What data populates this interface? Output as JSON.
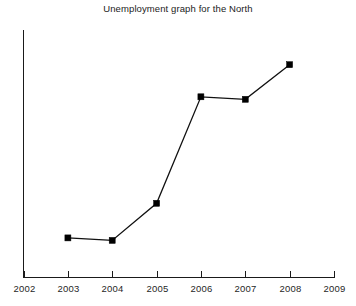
{
  "chart_data": {
    "type": "line",
    "title": "Unemployment graph for the North",
    "xlabel": "",
    "ylabel": "",
    "grid": false,
    "legend": false,
    "axis_ticks": [
      "2002",
      "2003",
      "2004",
      "2005",
      "2006",
      "2007",
      "2008",
      "2009"
    ],
    "xlim": [
      2002,
      2009
    ],
    "ylim": [
      0,
      100
    ],
    "y_axis_labeled": false,
    "categories": [
      2003,
      2004,
      2005,
      2006,
      2007,
      2008
    ],
    "values": [
      16,
      15,
      30,
      73,
      72,
      86
    ],
    "marker": "square",
    "marker_color": "#000000",
    "line_color": "#111111"
  },
  "axes": {
    "x_tick_labels": [
      "2002",
      "2003",
      "2004",
      "2005",
      "2006",
      "2007",
      "2008",
      "2009"
    ]
  }
}
